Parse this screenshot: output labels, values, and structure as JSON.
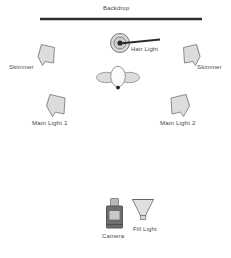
{
  "diagram": {
    "title_label": "Backdrop",
    "type": "studio-lighting-setup-overhead-diagram",
    "background_color": "#ffffff",
    "stroke_color": "#555555",
    "fill_color": "#d8d8d8",
    "text_color": "#4a4a4a",
    "canvas": {
      "width": 231,
      "height": 258
    }
  },
  "elements": {
    "backdrop": {
      "label": "Backdrop",
      "icon": "horizontal-bar-icon",
      "color": "#2e2e2e",
      "x1": 40,
      "y1": 19,
      "x2": 202,
      "y2": 19,
      "label_x": 103,
      "label_y": 5
    },
    "hair_light": {
      "label": "Hair Light",
      "icon": "hair-light-icon",
      "x": 120,
      "y": 44,
      "label_x": 131,
      "label_y": 48,
      "boom_angle_deg": -12
    },
    "subject": {
      "label": "",
      "icon": "subject-overhead-icon",
      "x": 117,
      "y": 79
    },
    "skimmer_left": {
      "label": "Skimmer",
      "icon": "skimmer-light-icon",
      "x": 45,
      "y": 56,
      "label_x": 10,
      "label_y": 64
    },
    "skimmer_right": {
      "label": "Skimmer",
      "icon": "skimmer-light-icon",
      "x": 190,
      "y": 56,
      "label_x": 198,
      "label_y": 64
    },
    "main_light_1": {
      "label": "Main Light 1",
      "icon": "main-light-icon",
      "x": 56,
      "y": 105,
      "label_x": 33,
      "label_y": 120
    },
    "main_light_2": {
      "label": "Main Light 2",
      "icon": "main-light-icon",
      "x": 178,
      "y": 105,
      "label_x": 161,
      "label_y": 120
    },
    "camera": {
      "label": "Camera",
      "icon": "camera-icon",
      "x": 112,
      "y": 215,
      "label_x": 103,
      "label_y": 233,
      "body_color": "#6f6f6f",
      "screen_color": "#c9c9c9"
    },
    "fill_light": {
      "label": "Fill Light",
      "icon": "fill-light-icon",
      "x": 142,
      "y": 212,
      "label_x": 134,
      "label_y": 226
    }
  }
}
